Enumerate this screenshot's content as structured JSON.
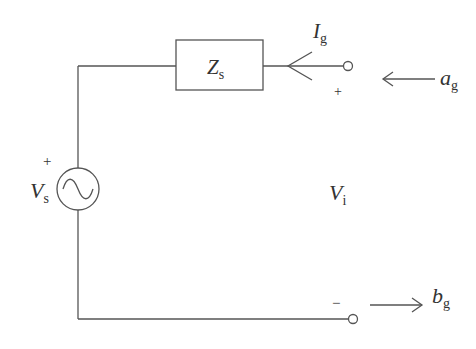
{
  "diagram": {
    "type": "circuit",
    "components": {
      "source": {
        "symbol": "V",
        "subscript": "s",
        "polarity_plus": "+"
      },
      "impedance": {
        "symbol": "Z",
        "subscript": "s"
      },
      "current": {
        "symbol": "I",
        "subscript": "g"
      },
      "terminal_voltage": {
        "symbol": "V",
        "subscript": "i",
        "plus": "+",
        "minus": "−"
      },
      "incident_wave": {
        "symbol": "a",
        "subscript": "g"
      },
      "reflected_wave": {
        "symbol": "b",
        "subscript": "g"
      }
    },
    "colors": {
      "line": "#555555",
      "text": "#333333"
    }
  }
}
